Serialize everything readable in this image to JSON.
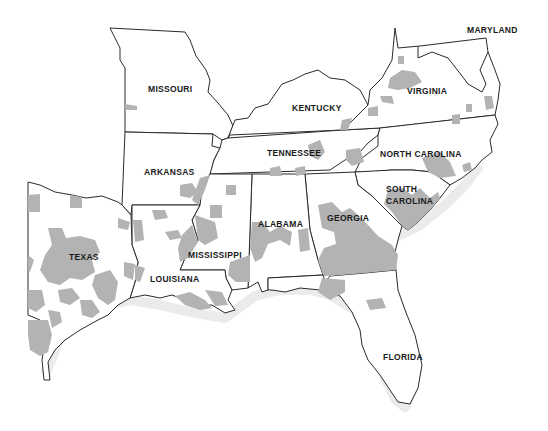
{
  "map": {
    "type": "choropleth-shaded-regions",
    "shade_color": "#b3b3b3",
    "outline_color": "#2a2a2a",
    "background": "#ffffff",
    "states": [
      {
        "id": "missouri",
        "label": "MISSOURI",
        "x": 148,
        "y": 92
      },
      {
        "id": "kentucky",
        "label": "KENTUCKY",
        "x": 292,
        "y": 111
      },
      {
        "id": "virginia",
        "label": "VIRGINIA",
        "x": 407,
        "y": 94
      },
      {
        "id": "maryland",
        "label": "MARYLAND",
        "x": 467,
        "y": 33
      },
      {
        "id": "arkansas",
        "label": "ARKANSAS",
        "x": 144,
        "y": 175
      },
      {
        "id": "tennessee",
        "label": "TENNESSEE",
        "x": 267,
        "y": 156
      },
      {
        "id": "north-carolina",
        "label": "NORTH CAROLINA",
        "x": 380,
        "y": 157
      },
      {
        "id": "south-carolina-line1",
        "label": "SOUTH",
        "x": 386,
        "y": 192
      },
      {
        "id": "south-carolina-line2",
        "label": "CAROLINA",
        "x": 386,
        "y": 204
      },
      {
        "id": "georgia",
        "label": "GEORGIA",
        "x": 327,
        "y": 221
      },
      {
        "id": "alabama",
        "label": "ALABAMA",
        "x": 258,
        "y": 227
      },
      {
        "id": "mississippi",
        "label": "MISSISSIPPI",
        "x": 188,
        "y": 258
      },
      {
        "id": "texas",
        "label": "TEXAS",
        "x": 69,
        "y": 260
      },
      {
        "id": "louisiana",
        "label": "LOUISIANA",
        "x": 150,
        "y": 282
      },
      {
        "id": "florida",
        "label": "FLORIDA",
        "x": 383,
        "y": 360
      }
    ]
  }
}
